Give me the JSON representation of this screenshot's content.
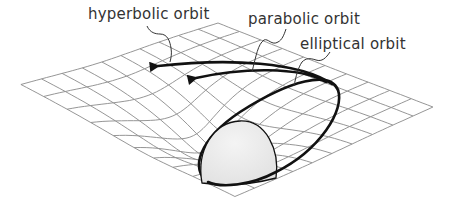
{
  "diagram": {
    "labels": {
      "hyperbolic": "hyperbolic orbit",
      "parabolic": "parabolic orbit",
      "elliptical": "elliptical orbit"
    },
    "colors": {
      "background": "#ffffff",
      "grid": "#8a8a8a",
      "orbit": "#111111",
      "mass_fill": "#ececec",
      "text": "#333333"
    },
    "grid": {
      "corners": {
        "top": [
          218,
          23
        ],
        "left": [
          20,
          84
        ],
        "right": [
          433,
          107
        ],
        "bottom": [
          235,
          196
        ]
      },
      "divisions": 10,
      "well_center": [
        222,
        158
      ]
    },
    "elements": [
      {
        "type": "central-mass",
        "shape": "hemisphere"
      },
      {
        "type": "orbit",
        "kind": "elliptical",
        "closed": true
      },
      {
        "type": "orbit",
        "kind": "parabolic",
        "arrow": true
      },
      {
        "type": "orbit",
        "kind": "hyperbolic",
        "arrow": true
      }
    ]
  }
}
